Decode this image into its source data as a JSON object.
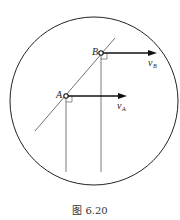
{
  "figure": {
    "caption": "图 6.20",
    "points": [
      {
        "label": "A",
        "velocity_label": "v",
        "velocity_sub": "A"
      },
      {
        "label": "B",
        "velocity_label": "v",
        "velocity_sub": "B"
      }
    ]
  }
}
